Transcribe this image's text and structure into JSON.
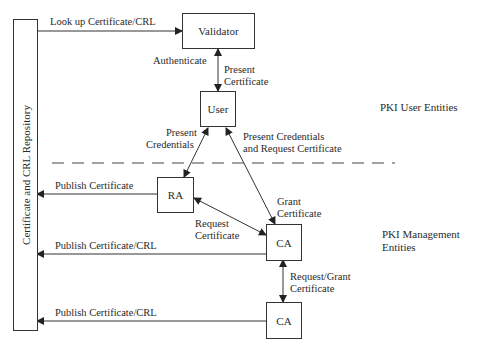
{
  "diagram": {
    "repository": {
      "label": "Certificate and CRL Repository"
    },
    "nodes": {
      "validator": "Validator",
      "user": "User",
      "ra": "RA",
      "ca1": "CA",
      "ca2": "CA"
    },
    "edges": {
      "lookup": "Look up Certificate/CRL",
      "authenticate": "Authenticate",
      "present_cert_1": "Present",
      "present_cert_2": "Certificate",
      "present_cred_1": "Present",
      "present_cred_2": "Credentials",
      "present_req_1": "Present Credentials",
      "present_req_2": "and Request Certificate",
      "publish_cert": "Publish Certificate",
      "grant_1": "Grant",
      "grant_2": "Certificate",
      "request_1": "Request",
      "request_2": "Certificate",
      "publish_crl_1": "Publish Certificate/CRL",
      "reqgrant_1": "Request/Grant",
      "reqgrant_2": "Certificate",
      "publish_crl_2": "Publish Certificate/CRL"
    },
    "regions": {
      "user_entities": "PKI User Entities",
      "mgmt_1": "PKI Management",
      "mgmt_2": "Entities"
    }
  }
}
